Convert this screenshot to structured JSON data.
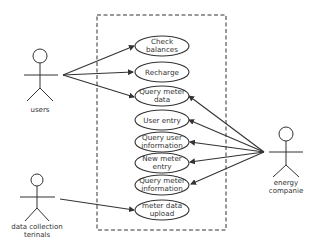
{
  "diagram": {
    "type": "use-case",
    "colors": {
      "stroke": "#333333",
      "background": "#ffffff"
    },
    "actors": [
      {
        "id": "users",
        "label": "users"
      },
      {
        "id": "terminals",
        "label_line1": "data collection",
        "label_line2": "terinals"
      },
      {
        "id": "energy",
        "label_line1": "energy",
        "label_line2": "companie"
      }
    ],
    "use_cases": [
      {
        "line1": "Check",
        "line2": "balances"
      },
      {
        "line1": "Recharge",
        "line2": ""
      },
      {
        "line1": "Query meter",
        "line2": "data"
      },
      {
        "line1": "User entry",
        "line2": ""
      },
      {
        "line1": "Query user",
        "line2": "information"
      },
      {
        "line1": "New meter",
        "line2": "entry"
      },
      {
        "line1": "Query meter",
        "line2": "information"
      },
      {
        "line1": "meter data",
        "line2": "upload"
      }
    ],
    "associations": [
      {
        "from": "users",
        "to": "Check balances"
      },
      {
        "from": "users",
        "to": "Recharge"
      },
      {
        "from": "users",
        "to": "Query meter data"
      },
      {
        "from": "energy companie",
        "to": "Query meter data"
      },
      {
        "from": "energy companie",
        "to": "User entry"
      },
      {
        "from": "energy companie",
        "to": "Query user information"
      },
      {
        "from": "energy companie",
        "to": "New meter entry"
      },
      {
        "from": "energy companie",
        "to": "Query meter information"
      },
      {
        "from": "data collection terinals",
        "to": "meter data upload"
      }
    ]
  }
}
